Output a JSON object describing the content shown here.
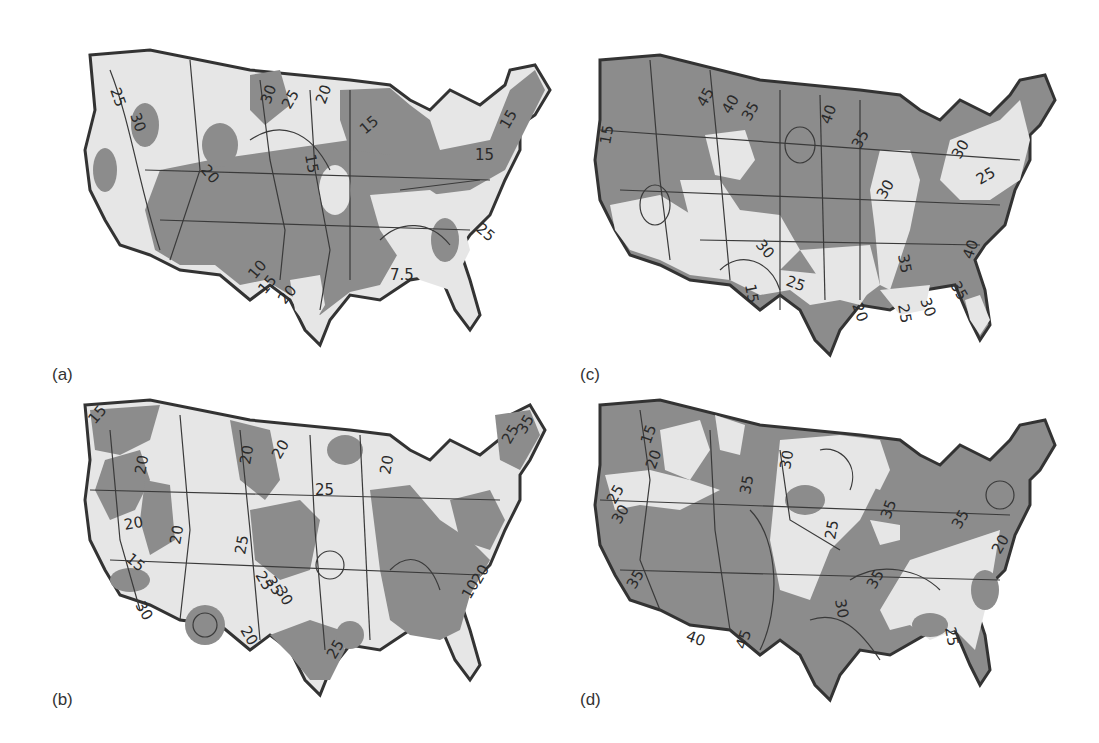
{
  "figure": {
    "colors": {
      "background": "#ffffff",
      "dark_fill": "#8c8c8c",
      "light_fill": "#e6e6e6",
      "outline": "#333333",
      "contour_line": "#3a3a3a"
    },
    "panels": [
      {
        "id": "a",
        "label": "(a)",
        "contour_labels": [
          "25",
          "30",
          "30",
          "25",
          "20",
          "20",
          "15",
          "15",
          "15",
          "10",
          "15",
          "20",
          "25",
          "15",
          "7.5"
        ]
      },
      {
        "id": "b",
        "label": "(b)",
        "contour_labels": [
          "15",
          "20",
          "20",
          "20",
          "20",
          "25",
          "30",
          "20",
          "15",
          "10",
          "25",
          "25",
          "35",
          "30",
          "20",
          "20",
          "25",
          "20",
          "25",
          "30",
          "35",
          "10",
          "20",
          "30"
        ]
      },
      {
        "id": "c",
        "label": "(c)",
        "contour_labels": [
          "40",
          "45",
          "40",
          "35",
          "40",
          "35",
          "30",
          "30",
          "25",
          "30",
          "25",
          "15",
          "20",
          "35",
          "25",
          "30",
          "35",
          "40"
        ]
      },
      {
        "id": "d",
        "label": "(d)",
        "contour_labels": [
          "15",
          "20",
          "25",
          "30",
          "35",
          "35",
          "30",
          "35",
          "25",
          "30",
          "35",
          "35",
          "40",
          "45",
          "25",
          "20",
          "25"
        ]
      }
    ]
  }
}
